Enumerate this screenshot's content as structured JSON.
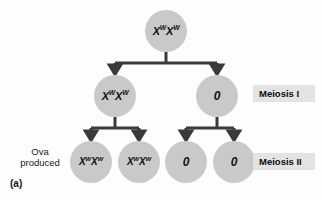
{
  "figure": {
    "panel_letter": "(a)",
    "side_note_line1": "Ova",
    "side_note_line2": "produced",
    "colors": {
      "cell_fill": "#c9c9c9",
      "connector": "#3a3a3a",
      "label_box": "#e3e3e3",
      "background": "#fdfdfd",
      "text": "#111111"
    }
  },
  "cells": {
    "parent": {
      "allele1": "X",
      "sup1": "W",
      "allele2": "X",
      "sup2": "W"
    },
    "meiosis1_left": {
      "allele1": "X",
      "sup1": "W",
      "allele2": "X",
      "sup2": "W"
    },
    "meiosis1_right": {
      "value": "0"
    },
    "ovum1": {
      "allele1": "X",
      "sup1": "W",
      "allele2": "X",
      "sup2": "W"
    },
    "ovum2": {
      "allele1": "X",
      "sup1": "W",
      "allele2": "X",
      "sup2": "W"
    },
    "ovum3": {
      "value": "0"
    },
    "ovum4": {
      "value": "0"
    }
  },
  "stages": {
    "meiosis_1": "Meiosis I",
    "meiosis_2": "Meiosis II"
  }
}
